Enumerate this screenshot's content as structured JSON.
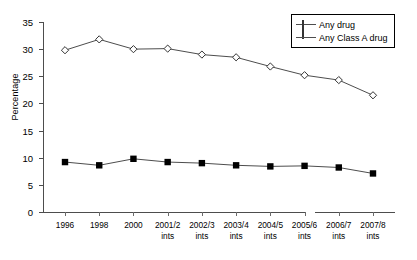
{
  "chart_data": {
    "type": "line",
    "title": "",
    "xlabel": "",
    "ylabel": "Percentage",
    "ylim": [
      0,
      35
    ],
    "yticks": [
      0,
      5,
      10,
      15,
      20,
      25,
      30,
      35
    ],
    "grid": false,
    "legend_position": "top-right",
    "axis_break_after_category": "2004/5 ints",
    "categories": [
      "1996",
      "1998",
      "2000",
      "2001/2 ints",
      "2002/3 ints",
      "2003/4 ints",
      "2004/5 ints",
      "2005/6 ints",
      "2006/7 ints",
      "2007/8 ints"
    ],
    "category_lines": [
      [
        "1996",
        ""
      ],
      [
        "1998",
        ""
      ],
      [
        "2000",
        ""
      ],
      [
        "2001/2",
        "ints"
      ],
      [
        "2002/3",
        "ints"
      ],
      [
        "2003/4",
        "ints"
      ],
      [
        "2004/5",
        "ints"
      ],
      [
        "2005/6",
        "ints"
      ],
      [
        "2006/7",
        "ints"
      ],
      [
        "2007/8",
        "ints"
      ]
    ],
    "series": [
      {
        "name": "Any drug",
        "marker": "open-diamond",
        "color": "#333333",
        "values": [
          29.8,
          31.8,
          30.0,
          30.1,
          29.0,
          28.5,
          26.8,
          25.2,
          24.3,
          21.5
        ]
      },
      {
        "name": "Any Class A drug",
        "marker": "filled-square",
        "color": "#000000",
        "values": [
          9.2,
          8.6,
          9.8,
          9.2,
          9.0,
          8.6,
          8.4,
          8.5,
          8.2,
          7.1
        ]
      }
    ]
  },
  "legend": {
    "items": [
      {
        "label": "Any drug",
        "marker": "open-diamond"
      },
      {
        "label": "Any Class A drug",
        "marker": "filled-square"
      }
    ]
  },
  "colors": {
    "axis": "#4d4d4d",
    "line": "#4d4d4d",
    "series_a": "#333333",
    "series_b": "#000000",
    "background": "#ffffff"
  }
}
